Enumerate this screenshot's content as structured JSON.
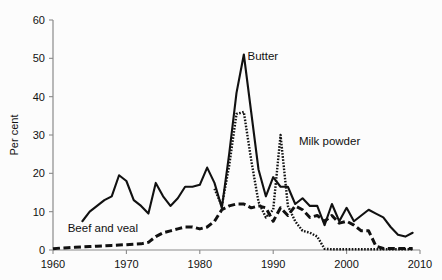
{
  "chart_data": {
    "type": "line",
    "title": "",
    "xlabel": "",
    "ylabel": "Per cent",
    "xlim": [
      1960,
      2010
    ],
    "ylim": [
      0,
      60
    ],
    "xticks": [
      1960,
      1970,
      1980,
      1990,
      2000,
      2010
    ],
    "yticks": [
      0,
      10,
      20,
      30,
      40,
      50,
      60
    ],
    "grid": false,
    "legend_position": "inline-annotations",
    "annotations": [
      {
        "text": "Butter",
        "x": 1986.5,
        "y": 49.5,
        "series": "Butter"
      },
      {
        "text": "Milk powder",
        "x": 1993.5,
        "y": 27.5,
        "series": "Milk powder"
      },
      {
        "text": "Beef and veal",
        "x": 1962.0,
        "y": 4.6,
        "series": "Beef and veal"
      }
    ],
    "series": [
      {
        "name": "Butter",
        "style": "solid",
        "x": [
          1964,
          1965,
          1966,
          1967,
          1968,
          1969,
          1970,
          1971,
          1972,
          1973,
          1974,
          1975,
          1976,
          1977,
          1978,
          1979,
          1980,
          1981,
          1982,
          1983,
          1984,
          1985,
          1986,
          1987,
          1988,
          1989,
          1990,
          1991,
          1992,
          1993,
          1994,
          1995,
          1996,
          1997,
          1998,
          1999,
          2000,
          2001,
          2002,
          2003,
          2004,
          2005,
          2006,
          2007,
          2008,
          2009
        ],
        "values": [
          7.5,
          10.0,
          11.5,
          13.0,
          14.0,
          19.5,
          18.0,
          13.0,
          11.5,
          9.5,
          17.5,
          14.0,
          11.5,
          13.5,
          16.5,
          16.5,
          17.0,
          21.5,
          17.5,
          11.0,
          25.0,
          41.0,
          51.0,
          36.0,
          21.0,
          14.0,
          19.0,
          16.5,
          16.5,
          12.0,
          13.5,
          11.5,
          11.5,
          6.5,
          12.0,
          7.5,
          11.0,
          7.5,
          9.0,
          10.5,
          9.5,
          8.5,
          6.0,
          4.0,
          3.5,
          4.5
        ]
      },
      {
        "name": "Milk powder",
        "style": "dotted",
        "x": [
          1982,
          1983,
          1984,
          1985,
          1986,
          1987,
          1988,
          1989,
          1990,
          1991,
          1992,
          1993,
          1994,
          1995,
          1996,
          1997,
          1998,
          1999,
          2000,
          2001,
          2002,
          2003,
          2004,
          2005,
          2006,
          2007,
          2008,
          2009
        ],
        "values": [
          16.0,
          11.5,
          22.0,
          35.5,
          36.0,
          23.5,
          12.5,
          8.5,
          10.5,
          30.0,
          11.5,
          7.5,
          5.0,
          4.5,
          3.5,
          0.3,
          0.2,
          0.2,
          0.2,
          0.2,
          0.2,
          0.2,
          0.2,
          0.2,
          0.2,
          0.2,
          0.2,
          0.2
        ]
      },
      {
        "name": "Beef and veal",
        "style": "dashed",
        "x": [
          1960,
          1961,
          1962,
          1963,
          1964,
          1965,
          1966,
          1967,
          1968,
          1969,
          1970,
          1971,
          1972,
          1973,
          1974,
          1975,
          1976,
          1977,
          1978,
          1979,
          1980,
          1981,
          1982,
          1983,
          1984,
          1985,
          1986,
          1987,
          1988,
          1989,
          1990,
          1991,
          1992,
          1993,
          1994,
          1995,
          1996,
          1997,
          1998,
          1999,
          2000,
          2001,
          2002,
          2003,
          2004,
          2005,
          2006,
          2007,
          2008,
          2009
        ],
        "values": [
          0.3,
          0.5,
          0.6,
          0.7,
          0.8,
          0.9,
          1.0,
          1.1,
          1.2,
          1.3,
          1.4,
          1.5,
          1.6,
          2.0,
          3.5,
          4.5,
          5.0,
          5.5,
          6.0,
          6.0,
          5.5,
          6.0,
          7.5,
          10.5,
          11.5,
          12.0,
          12.0,
          11.0,
          11.5,
          11.0,
          7.5,
          11.0,
          9.0,
          11.5,
          10.5,
          8.5,
          9.0,
          7.5,
          9.0,
          7.0,
          7.5,
          6.5,
          5.0,
          5.0,
          1.0,
          0.4,
          0.4,
          0.4,
          0.4,
          0.4
        ]
      }
    ]
  },
  "axis": {
    "y_label": "Per cent",
    "y_tick_labels": [
      "0",
      "10",
      "20",
      "30",
      "40",
      "50",
      "60"
    ],
    "x_tick_labels": [
      "1960",
      "1970",
      "1980",
      "1990",
      "2000",
      "2010"
    ]
  },
  "labels": {
    "butter": "Butter",
    "milk_powder": "Milk powder",
    "beef_and_veal": "Beef and veal"
  },
  "colors": {
    "ink": "#111111",
    "axis": "#8a8a8a",
    "background": "#fcfcfc"
  }
}
